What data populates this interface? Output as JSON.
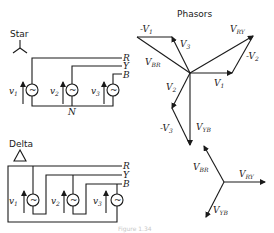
{
  "title": "Phasors",
  "caption": "Figure 1.34",
  "star": {
    "label": "Star",
    "lines": [
      "R",
      "Y",
      "B"
    ],
    "neutral": "N",
    "sources": [
      {
        "label": "v",
        "sub": "1"
      },
      {
        "label": "v",
        "sub": "2"
      },
      {
        "label": "v",
        "sub": "3"
      }
    ],
    "source_glyph": "~"
  },
  "delta": {
    "label": "Delta",
    "lines": [
      "R",
      "Y",
      "B"
    ],
    "sources": [
      {
        "label": "v",
        "sub": "1"
      },
      {
        "label": "v",
        "sub": "2"
      },
      {
        "label": "v",
        "sub": "3"
      }
    ],
    "source_glyph": "~"
  },
  "phasors_star": {
    "v1": {
      "label": "V",
      "sub": "1"
    },
    "v2": {
      "label": "V",
      "sub": "2"
    },
    "v3": {
      "label": "V",
      "sub": "3"
    },
    "neg_v1": {
      "label": "-V",
      "sub": "1"
    },
    "neg_v2": {
      "label": "-V",
      "sub": "2"
    },
    "neg_v3": {
      "label": "-V",
      "sub": "3"
    },
    "v_ry": {
      "label": "V",
      "sub": "RY"
    },
    "v_br": {
      "label": "V",
      "sub": "BR"
    },
    "v_yb": {
      "label": "V",
      "sub": "YB"
    }
  },
  "phasors_line": {
    "v_ry": {
      "label": "V",
      "sub": "RY"
    },
    "v_br": {
      "label": "V",
      "sub": "BR"
    },
    "v_yb": {
      "label": "V",
      "sub": "YB"
    }
  }
}
